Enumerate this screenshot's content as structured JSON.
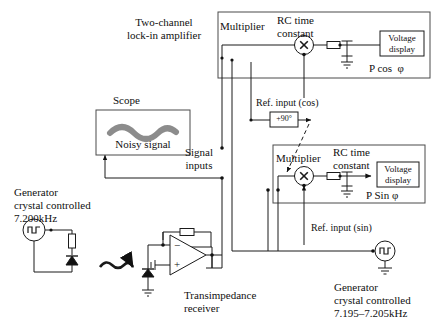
{
  "diagram": {
    "title_block": "Two-channel\nlock-in amplifier",
    "scope_label": "Scope",
    "noisy_signal_label": "Noisy signal",
    "signal_inputs_label": "Signal\ninputs",
    "generator_left": "Generator\ncrystal controlled\n7.200kHz",
    "generator_right": "Generator\ncrystal controlled\n7.195–7.205kHz",
    "transimpedance_label": "Transimpedance\nreceiver",
    "phase_shift_box": "+90°",
    "ref_input_cos": "Ref. input (cos)",
    "ref_input_sin": "Ref. input (sin)",
    "channel_cos": {
      "multiplier_label": "Multiplier",
      "rc_label": "RC time\nconstant",
      "display_label": "Voltage\ndisplay",
      "output_label": "P cos  φ",
      "multiplier_symbol": "×"
    },
    "channel_sin": {
      "multiplier_label": "Multiplier",
      "rc_label": "RC time\nconstant",
      "display_label": "Voltage\ndisplay",
      "output_label": "P Sin φ",
      "multiplier_symbol": "×"
    },
    "opamp_minus": "−",
    "opamp_plus": "+",
    "colors": {
      "wire": "#1a1a1a",
      "box": "#2b2b2b",
      "noise_trace": "#8c8c8c",
      "background": "#ffffff",
      "panel_border": "#4a4a4a"
    }
  }
}
